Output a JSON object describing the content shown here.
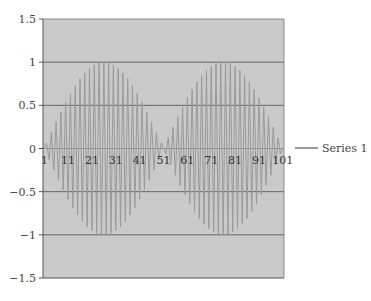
{
  "chart_data": {
    "type": "line",
    "title": "",
    "xlabel": "",
    "ylabel": "",
    "ylim": [
      -1.5,
      1.5
    ],
    "yticks": [
      1.5,
      1,
      0.5,
      0,
      -0.5,
      -1,
      -1.5
    ],
    "ytick_labels": [
      "1.5",
      "1",
      "0.5",
      "0",
      "−0.5",
      "−1",
      "−1.5"
    ],
    "x_range": [
      1,
      101
    ],
    "xtick_labels": [
      "1",
      "11",
      "21",
      "31",
      "41",
      "51",
      "61",
      "71",
      "81",
      "91",
      "101"
    ],
    "grid": true,
    "legend_position": "right",
    "series": [
      {
        "name": "Series 1",
        "formula": "y_i = (-1)^i * sin(pi*(i-1)/50), i = 1..101",
        "envelope_peaks": [
          {
            "x": 26,
            "y": 1
          },
          {
            "x": 76,
            "y": 1
          }
        ],
        "envelope_troughs": [
          {
            "x": 26,
            "y": -1
          },
          {
            "x": 76,
            "y": -1
          }
        ],
        "zeros_at": [
          1,
          51,
          101
        ]
      }
    ]
  },
  "colors": {
    "plot_background": "#cacaca",
    "gridline": "#666666",
    "series_line": "#9a9a9a",
    "axis": "#555555"
  },
  "legend": {
    "label": "Series 1"
  }
}
